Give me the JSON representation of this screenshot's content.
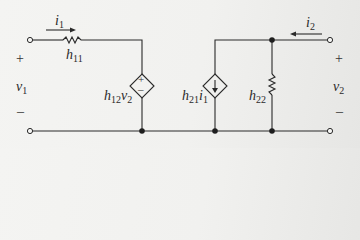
{
  "diagram": {
    "type": "h-parameter two-port equivalent circuit",
    "colors": {
      "wire": "#2a2a2a",
      "background": "#f2f2f0"
    },
    "port1": {
      "current": {
        "symbol": "i",
        "sub": "1",
        "direction": "right"
      },
      "voltage": {
        "symbol": "v",
        "sub": "1"
      },
      "plus": "+",
      "minus": "–"
    },
    "port2": {
      "current": {
        "symbol": "i",
        "sub": "2",
        "direction": "left"
      },
      "voltage": {
        "symbol": "v",
        "sub": "2"
      },
      "plus": "+",
      "minus": "–"
    },
    "elements": {
      "h11": {
        "symbol": "h",
        "sub": "11",
        "kind": "resistor"
      },
      "h12v2": {
        "symbol": "h",
        "sub": "12",
        "tail": "v",
        "tail_sub": "2",
        "kind": "dependent-voltage-source",
        "plus": "+",
        "minus": "–"
      },
      "h21i1": {
        "symbol": "h",
        "sub": "21",
        "tail": "i",
        "tail_sub": "1",
        "kind": "dependent-current-source"
      },
      "h22": {
        "symbol": "h",
        "sub": "22",
        "kind": "resistor"
      }
    }
  }
}
